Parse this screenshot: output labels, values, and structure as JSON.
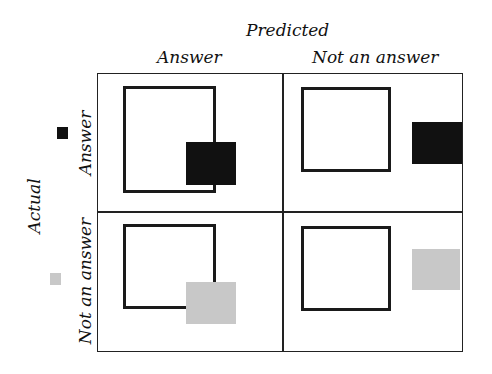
{
  "title": "Predicted",
  "columns": [
    "Answer",
    "Not an answer"
  ],
  "row_axis_title": "Actual",
  "rows": [
    "Answer",
    "Not an answer"
  ],
  "legend": [
    {
      "row": "Answer",
      "color": "#111111"
    },
    {
      "row": "Not an answer",
      "color": "#c8c8c8"
    }
  ],
  "cells": [
    {
      "actual": "Answer",
      "predicted": "Answer",
      "fill_color": "#111111"
    },
    {
      "actual": "Answer",
      "predicted": "Not an answer",
      "fill_color": "#111111"
    },
    {
      "actual": "Not an answer",
      "predicted": "Answer",
      "fill_color": "#c8c8c8"
    },
    {
      "actual": "Not an answer",
      "predicted": "Not an answer",
      "fill_color": "#c8c8c8"
    }
  ]
}
